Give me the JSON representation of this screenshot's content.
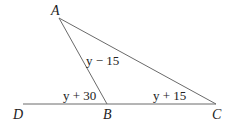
{
  "diagram": {
    "points": {
      "A": {
        "label": "A",
        "x": 59,
        "y": 18
      },
      "B": {
        "label": "B",
        "x": 107,
        "y": 104
      },
      "C": {
        "label": "C",
        "x": 216,
        "y": 104
      },
      "D": {
        "label": "D",
        "x": 23,
        "y": 104
      }
    },
    "angles": {
      "at_A": "y − 15",
      "at_B_exterior": "y + 30",
      "at_C": "y + 15"
    },
    "colors": {
      "line": "#666666",
      "text": "#222222"
    }
  }
}
